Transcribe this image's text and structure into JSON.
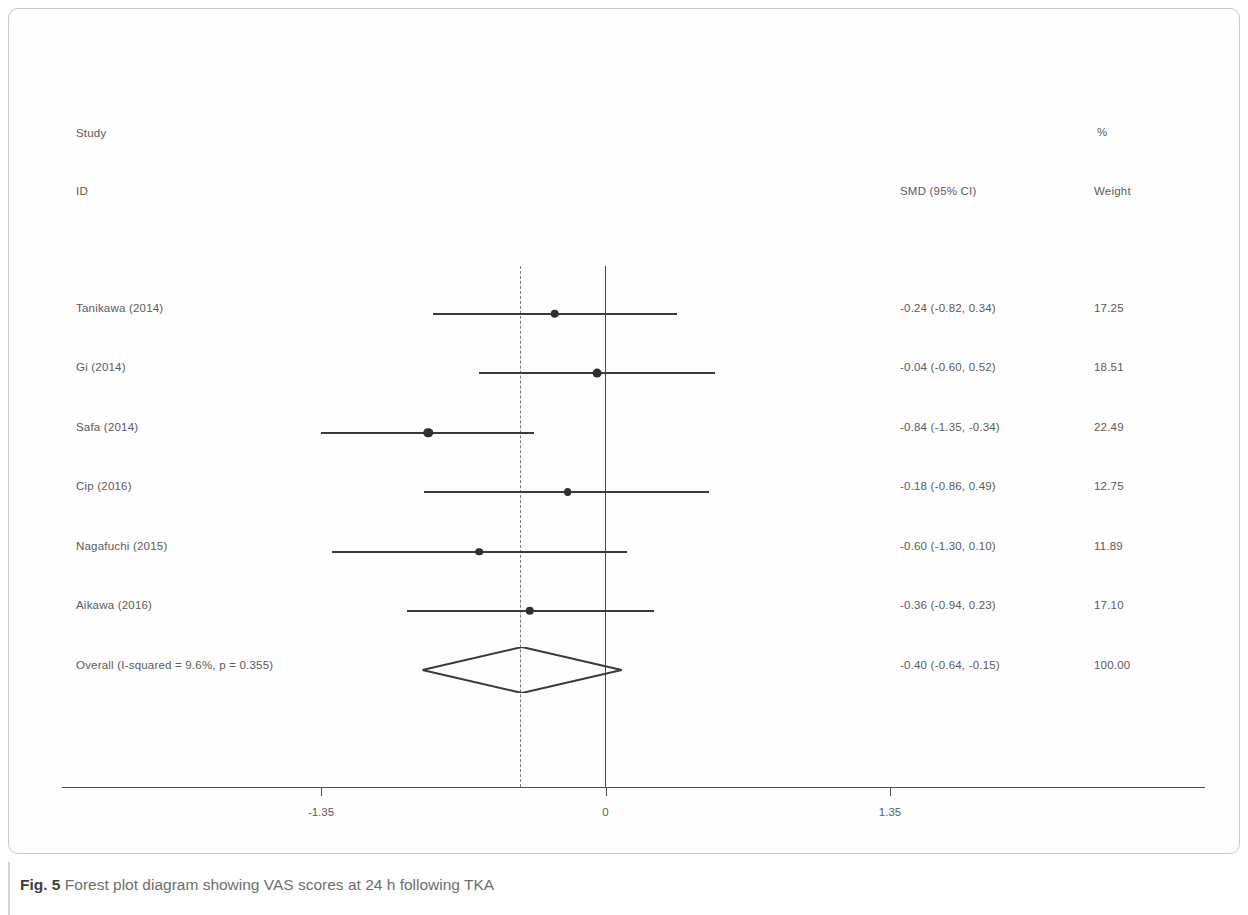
{
  "figure": {
    "caption_number": "Fig. 5",
    "caption_text": " Forest plot diagram showing VAS scores at 24 h following TKA"
  },
  "headers": {
    "study": "Study",
    "id": "ID",
    "percent": "%",
    "smd": "SMD (95% CI)",
    "weight": "Weight"
  },
  "chart_data": {
    "type": "forest",
    "title": "Forest plot diagram showing VAS scores at 24 h following TKA",
    "effect_measure": "SMD (95% CI)",
    "xlabel": "",
    "ylabel": "",
    "xlim": [
      -1.92,
      1.92
    ],
    "xticks": [
      -1.35,
      0,
      1.35
    ],
    "xtick_labels": [
      "-1.35",
      "0",
      "1.35"
    ],
    "null_line": 0,
    "pooled_line": -0.4,
    "grid": false,
    "heterogeneity": {
      "i_squared": "9.6%",
      "p_value": "0.355"
    },
    "studies": [
      {
        "label": "Tanikawa  (2014)",
        "estimate": -0.24,
        "ci_low": -0.82,
        "ci_high": 0.34,
        "smd_text": "-0.24 (-0.82, 0.34)",
        "weight": 17.25,
        "weight_text": "17.25"
      },
      {
        "label": "Gi (2014)",
        "estimate": -0.04,
        "ci_low": -0.6,
        "ci_high": 0.52,
        "smd_text": "-0.04 (-0.60, 0.52)",
        "weight": 18.51,
        "weight_text": "18.51"
      },
      {
        "label": "Safa (2014)",
        "estimate": -0.84,
        "ci_low": -1.35,
        "ci_high": -0.34,
        "smd_text": "-0.84 (-1.35, -0.34)",
        "weight": 22.49,
        "weight_text": "22.49"
      },
      {
        "label": "Cip  (2016)",
        "estimate": -0.18,
        "ci_low": -0.86,
        "ci_high": 0.49,
        "smd_text": "-0.18 (-0.86, 0.49)",
        "weight": 12.75,
        "weight_text": "12.75"
      },
      {
        "label": "Nagafuchi  (2015)",
        "estimate": -0.6,
        "ci_low": -1.3,
        "ci_high": 0.1,
        "smd_text": "-0.60 (-1.30, 0.10)",
        "weight": 11.89,
        "weight_text": "11.89"
      },
      {
        "label": "Aikawa (2016)",
        "estimate": -0.36,
        "ci_low": -0.94,
        "ci_high": 0.23,
        "smd_text": "-0.36 (-0.94, 0.23)",
        "weight": 17.1,
        "weight_text": "17.10"
      }
    ],
    "overall": {
      "label": "Overall  (I-squared = 9.6%, p = 0.355)",
      "estimate": -0.4,
      "ci_low": -0.64,
      "ci_high": -0.15,
      "smd_text": "-0.40 (-0.64, -0.15)",
      "weight": 100.0,
      "weight_text": "100.00"
    },
    "colors": {
      "line": "#3a3a3a",
      "marker": "#2f2f2f",
      "text": "#5b5b5b",
      "null_line": "#4d4d4d",
      "pooled_line": "#7a7a7a"
    }
  }
}
